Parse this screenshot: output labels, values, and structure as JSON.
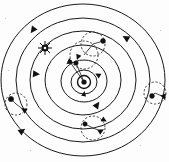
{
  "figure": {
    "title": "Concentric planetary orbit diagram",
    "kind": "astronomical-orbit-diagram",
    "background_color": "#fdfdfd",
    "line_color": "#1a1a1a",
    "canvas": {
      "width": 169,
      "height": 162
    },
    "center": {
      "x": 84,
      "y": 82
    },
    "rotation_direction": "counter-clockwise"
  },
  "chart_data": {
    "type": "scatter",
    "title": "Concentric planetary orbit diagram",
    "xlabel": "",
    "ylabel": "",
    "grid": false,
    "legend": "none",
    "center": {
      "x": 84,
      "y": 82
    },
    "orbits": [
      {
        "name": "orbit-1-innermost",
        "rx": 13,
        "ry": 12
      },
      {
        "name": "orbit-2",
        "rx": 23,
        "ry": 21
      },
      {
        "name": "orbit-3",
        "rx": 38,
        "ry": 35
      },
      {
        "name": "orbit-4",
        "rx": 53,
        "ry": 49
      },
      {
        "name": "orbit-5",
        "rx": 67,
        "ry": 62
      },
      {
        "name": "orbit-6-outermost",
        "rx": 82,
        "ry": 76
      }
    ],
    "bodies": [
      {
        "name": "central-sun",
        "x": 84,
        "y": 82,
        "marker": "sun-core",
        "orbit": "center"
      },
      {
        "name": "inner-planet-upper",
        "x": 76,
        "y": 63,
        "marker": "dot",
        "orbit": "orbit-2"
      },
      {
        "name": "star-symbol-left",
        "x": 45,
        "y": 48,
        "marker": "sun-rayed",
        "orbit": "orbit-4"
      },
      {
        "name": "planet-upper-right",
        "x": 103,
        "y": 41,
        "marker": "dot",
        "orbit": "orbit-5"
      },
      {
        "name": "planet-left-edge",
        "x": 11,
        "y": 99,
        "marker": "dot",
        "orbit": "orbit-6"
      },
      {
        "name": "planet-bottom",
        "x": 85,
        "y": 124,
        "marker": "dot",
        "orbit": "orbit-6"
      },
      {
        "name": "planet-right-edge",
        "x": 152,
        "y": 96,
        "marker": "dot",
        "orbit": "orbit-6"
      }
    ],
    "epicycles": [
      {
        "name": "epicycle-upper-right",
        "cx": 93,
        "cy": 44,
        "r": 12,
        "style": "dashed"
      },
      {
        "name": "epicycle-inner-upper",
        "cx": 84,
        "cy": 55,
        "r": 14,
        "style": "dashed"
      },
      {
        "name": "epicycle-left-edge",
        "cx": 16,
        "cy": 104,
        "r": 11,
        "style": "dashed"
      },
      {
        "name": "epicycle-bottom",
        "cx": 93,
        "cy": 128,
        "r": 12,
        "style": "dashed"
      },
      {
        "name": "epicycle-right-edge",
        "cx": 155,
        "cy": 93,
        "r": 11,
        "style": "dashed"
      }
    ],
    "direction_arrows": [
      {
        "name": "arrow-outer-upper-left",
        "x": 33,
        "y": 30,
        "angle": 215
      },
      {
        "name": "arrow-ring5-left",
        "x": 36,
        "y": 74,
        "angle": 95
      },
      {
        "name": "arrow-ring4-right",
        "x": 126,
        "y": 38,
        "angle": 300
      },
      {
        "name": "arrow-ring4-lower-right",
        "x": 97,
        "y": 105,
        "angle": 35
      },
      {
        "name": "arrow-ring6-bottom-left",
        "x": 22,
        "y": 131,
        "angle": 55
      },
      {
        "name": "arrow-ring3-inner-left",
        "x": 69,
        "y": 62,
        "angle": 230
      },
      {
        "name": "arrow-ring2-right",
        "x": 98,
        "y": 75,
        "angle": 300
      },
      {
        "name": "arrow-ring1-bottom",
        "x": 84,
        "y": 94,
        "angle": 10
      },
      {
        "name": "arrow-epicycle-bottom",
        "x": 101,
        "y": 131,
        "angle": 60
      },
      {
        "name": "arrow-epicycle-left",
        "x": 24,
        "y": 110,
        "angle": 300
      },
      {
        "name": "arrow-epicycle-right",
        "x": 164,
        "y": 97,
        "angle": 160
      }
    ]
  },
  "labels": {
    "caption": "",
    "annotations": []
  }
}
